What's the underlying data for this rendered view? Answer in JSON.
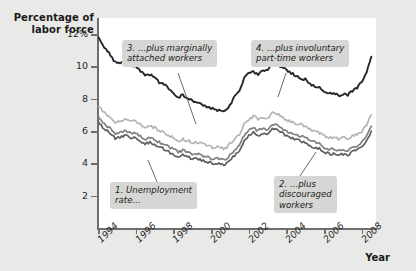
{
  "chart_data": {
    "type": "line",
    "title": "",
    "ylabel": "Percentage of labor force",
    "xlabel": "Year",
    "ylim": [
      0,
      13
    ],
    "xlim": [
      1994,
      2008.75
    ],
    "grid": false,
    "legend_position": "annotations",
    "ytick_labels": [
      "12%",
      "10",
      "8",
      "6",
      "4",
      "2"
    ],
    "ytick_values": [
      12,
      10,
      8,
      6,
      4,
      2
    ],
    "xtick_labels": [
      "1994",
      "1996",
      "1998",
      "2000",
      "2002",
      "2004",
      "2006",
      "2008"
    ],
    "xtick_values": [
      1994,
      1996,
      1998,
      2000,
      2002,
      2004,
      2006,
      2008
    ],
    "annotations": [
      {
        "id": "callout-1",
        "text": "1. Unemployment\nrate..."
      },
      {
        "id": "callout-2",
        "text": "2. ...plus\ndiscouraged\nworkers"
      },
      {
        "id": "callout-3",
        "text": "3. ...plus marginally\nattached workers"
      },
      {
        "id": "callout-4",
        "text": "4. ...plus involuntary\npart-time workers"
      }
    ],
    "series": [
      {
        "name": "1. Unemployment rate",
        "color": "#5f5f5f",
        "x": [
          1994.0,
          1994.25,
          1994.5,
          1994.75,
          1995.0,
          1995.25,
          1995.5,
          1995.75,
          1996.0,
          1996.25,
          1996.5,
          1996.75,
          1997.0,
          1997.25,
          1997.5,
          1997.75,
          1998.0,
          1998.25,
          1998.5,
          1998.75,
          1999.0,
          1999.25,
          1999.5,
          1999.75,
          2000.0,
          2000.25,
          2000.5,
          2000.75,
          2001.0,
          2001.25,
          2001.5,
          2001.75,
          2002.0,
          2002.25,
          2002.5,
          2002.75,
          2003.0,
          2003.25,
          2003.5,
          2003.75,
          2004.0,
          2004.25,
          2004.5,
          2004.75,
          2005.0,
          2005.25,
          2005.5,
          2005.75,
          2006.0,
          2006.25,
          2006.5,
          2006.75,
          2007.0,
          2007.25,
          2007.5,
          2007.75,
          2008.0,
          2008.25,
          2008.5
        ],
        "values": [
          6.6,
          6.2,
          6.0,
          5.7,
          5.5,
          5.7,
          5.7,
          5.6,
          5.6,
          5.4,
          5.2,
          5.3,
          5.2,
          5.0,
          4.9,
          4.7,
          4.6,
          4.4,
          4.5,
          4.4,
          4.3,
          4.3,
          4.2,
          4.1,
          4.0,
          4.0,
          4.0,
          3.9,
          4.2,
          4.5,
          4.8,
          5.4,
          5.7,
          5.9,
          5.7,
          5.9,
          5.8,
          6.1,
          6.1,
          5.9,
          5.7,
          5.6,
          5.5,
          5.4,
          5.3,
          5.1,
          5.0,
          4.9,
          4.7,
          4.6,
          4.6,
          4.5,
          4.6,
          4.5,
          4.7,
          4.8,
          5.0,
          5.4,
          6.0
        ]
      },
      {
        "name": "2. ...plus discouraged workers",
        "color": "#808080",
        "x": [
          1994.0,
          1994.25,
          1994.5,
          1994.75,
          1995.0,
          1995.25,
          1995.5,
          1995.75,
          1996.0,
          1996.25,
          1996.5,
          1996.75,
          1997.0,
          1997.25,
          1997.5,
          1997.75,
          1998.0,
          1998.25,
          1998.5,
          1998.75,
          1999.0,
          1999.25,
          1999.5,
          1999.75,
          2000.0,
          2000.25,
          2000.5,
          2000.75,
          2001.0,
          2001.25,
          2001.5,
          2001.75,
          2002.0,
          2002.25,
          2002.5,
          2002.75,
          2003.0,
          2003.25,
          2003.5,
          2003.75,
          2004.0,
          2004.25,
          2004.5,
          2004.75,
          2005.0,
          2005.25,
          2005.5,
          2005.75,
          2006.0,
          2006.25,
          2006.5,
          2006.75,
          2007.0,
          2007.25,
          2007.5,
          2007.75,
          2008.0,
          2008.25,
          2008.5
        ],
        "values": [
          6.9,
          6.5,
          6.3,
          6.0,
          5.8,
          6.0,
          6.0,
          5.9,
          5.9,
          5.7,
          5.5,
          5.6,
          5.5,
          5.3,
          5.2,
          5.0,
          4.9,
          4.7,
          4.8,
          4.7,
          4.6,
          4.6,
          4.5,
          4.4,
          4.3,
          4.3,
          4.3,
          4.2,
          4.5,
          4.8,
          5.1,
          5.7,
          6.0,
          6.2,
          6.0,
          6.2,
          6.1,
          6.4,
          6.4,
          6.2,
          6.0,
          5.9,
          5.8,
          5.7,
          5.6,
          5.4,
          5.3,
          5.2,
          5.0,
          4.9,
          4.9,
          4.8,
          4.9,
          4.8,
          5.0,
          5.1,
          5.3,
          5.7,
          6.3
        ]
      },
      {
        "name": "3. ...plus marginally attached workers",
        "color": "#b5b5b5",
        "x": [
          1994.0,
          1994.25,
          1994.5,
          1994.75,
          1995.0,
          1995.25,
          1995.5,
          1995.75,
          1996.0,
          1996.25,
          1996.5,
          1996.75,
          1997.0,
          1997.25,
          1997.5,
          1997.75,
          1998.0,
          1998.25,
          1998.5,
          1998.75,
          1999.0,
          1999.25,
          1999.5,
          1999.75,
          2000.0,
          2000.25,
          2000.5,
          2000.75,
          2001.0,
          2001.25,
          2001.5,
          2001.75,
          2002.0,
          2002.25,
          2002.5,
          2002.75,
          2003.0,
          2003.25,
          2003.5,
          2003.75,
          2004.0,
          2004.25,
          2004.5,
          2004.75,
          2005.0,
          2005.25,
          2005.5,
          2005.75,
          2006.0,
          2006.25,
          2006.5,
          2006.75,
          2007.0,
          2007.25,
          2007.5,
          2007.75,
          2008.0,
          2008.25,
          2008.5
        ],
        "values": [
          7.6,
          7.2,
          7.0,
          6.7,
          6.5,
          6.7,
          6.7,
          6.6,
          6.6,
          6.4,
          6.2,
          6.3,
          6.2,
          6.0,
          5.9,
          5.7,
          5.6,
          5.4,
          5.5,
          5.4,
          5.3,
          5.3,
          5.2,
          5.1,
          5.0,
          5.0,
          5.0,
          4.9,
          5.2,
          5.5,
          5.8,
          6.4,
          6.7,
          6.9,
          6.7,
          6.9,
          6.8,
          7.1,
          7.1,
          6.9,
          6.7,
          6.6,
          6.5,
          6.4,
          6.3,
          6.1,
          6.0,
          5.9,
          5.7,
          5.6,
          5.6,
          5.5,
          5.6,
          5.5,
          5.7,
          5.8,
          6.0,
          6.4,
          7.0
        ]
      },
      {
        "name": "4. ...plus involuntary part-time workers",
        "color": "#272727",
        "x": [
          1994.0,
          1994.25,
          1994.5,
          1994.75,
          1995.0,
          1995.25,
          1995.5,
          1995.75,
          1996.0,
          1996.25,
          1996.5,
          1996.75,
          1997.0,
          1997.25,
          1997.5,
          1997.75,
          1998.0,
          1998.25,
          1998.5,
          1998.75,
          1999.0,
          1999.25,
          1999.5,
          1999.75,
          2000.0,
          2000.25,
          2000.5,
          2000.75,
          2001.0,
          2001.25,
          2001.5,
          2001.75,
          2002.0,
          2002.25,
          2002.5,
          2002.75,
          2003.0,
          2003.25,
          2003.5,
          2003.75,
          2004.0,
          2004.25,
          2004.5,
          2004.75,
          2005.0,
          2005.25,
          2005.5,
          2005.75,
          2006.0,
          2006.25,
          2006.5,
          2006.75,
          2007.0,
          2007.25,
          2007.5,
          2007.75,
          2008.0,
          2008.25,
          2008.5
        ],
        "values": [
          11.8,
          11.3,
          11.0,
          10.5,
          10.2,
          10.3,
          10.3,
          10.1,
          10.0,
          9.7,
          9.5,
          9.5,
          9.4,
          9.0,
          8.9,
          8.6,
          8.4,
          8.1,
          8.2,
          8.0,
          7.9,
          7.8,
          7.7,
          7.5,
          7.4,
          7.3,
          7.3,
          7.2,
          7.6,
          8.1,
          8.5,
          9.3,
          9.6,
          9.7,
          9.5,
          9.7,
          9.7,
          10.2,
          10.3,
          9.9,
          9.8,
          9.6,
          9.4,
          9.3,
          9.2,
          8.9,
          8.8,
          8.7,
          8.5,
          8.3,
          8.3,
          8.2,
          8.3,
          8.2,
          8.5,
          8.7,
          9.1,
          9.7,
          10.6
        ]
      }
    ]
  }
}
